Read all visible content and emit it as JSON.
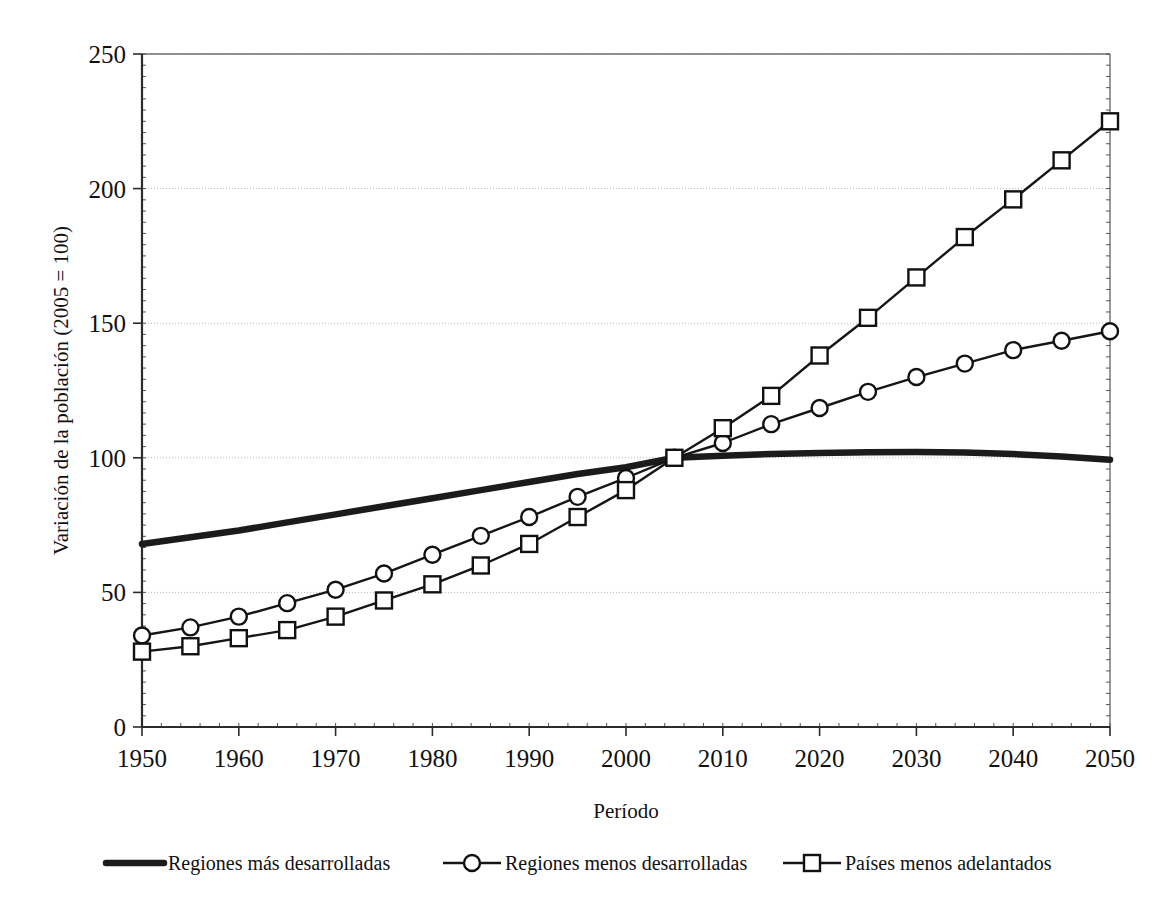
{
  "chart_data": {
    "type": "line",
    "title": "",
    "xlabel": "Período",
    "ylabel": "Variación de la población (2005 = 100)",
    "xlim": [
      1950,
      2050
    ],
    "ylim": [
      0,
      250
    ],
    "xticks": [
      1950,
      1960,
      1970,
      1980,
      1990,
      2000,
      2010,
      2020,
      2030,
      2040,
      2050
    ],
    "xtick_labels": [
      "1950",
      "1960",
      "1970",
      "1980",
      "1990",
      "2000",
      "2010",
      "2020",
      "2030",
      "2040",
      "2050"
    ],
    "yticks": [
      0,
      50,
      100,
      150,
      200,
      250
    ],
    "ytick_labels": [
      "0",
      "50",
      "100",
      "150",
      "200",
      "250"
    ],
    "grid": true,
    "grid_axis": "y",
    "legend_position": "bottom",
    "x": [
      1950,
      1955,
      1960,
      1965,
      1970,
      1975,
      1980,
      1985,
      1990,
      1995,
      2000,
      2005,
      2010,
      2015,
      2020,
      2025,
      2030,
      2035,
      2040,
      2045,
      2050
    ],
    "series": [
      {
        "name": "Regiones más desarrolladas",
        "marker": "none",
        "line_style": "thick",
        "color": "#1b1b1b",
        "values": [
          68,
          70.5,
          73,
          76,
          79,
          82,
          85,
          88,
          91,
          94,
          96.5,
          100,
          100.8,
          101.4,
          101.8,
          102.1,
          102.2,
          102,
          101.4,
          100.5,
          99.3
        ]
      },
      {
        "name": "Regiones menos desarrolladas",
        "marker": "circle",
        "line_style": "thin",
        "color": "#151515",
        "values": [
          34,
          37,
          41,
          46,
          51,
          57,
          64,
          71,
          78,
          85.5,
          92.5,
          100,
          105.5,
          112.5,
          118.5,
          124.5,
          130,
          135,
          140,
          143.5,
          147
        ]
      },
      {
        "name": "Países menos adelantados",
        "marker": "square",
        "line_style": "thin",
        "color": "#151515",
        "values": [
          28,
          30,
          33,
          36,
          41,
          47,
          53,
          60,
          68,
          78,
          88,
          100,
          111,
          123,
          138,
          152,
          167,
          182,
          196,
          210.5,
          225
        ]
      }
    ]
  },
  "legend": {
    "items": [
      {
        "label": "Regiones más desarrolladas",
        "marker": "none"
      },
      {
        "label": "Regiones menos desarrolladas",
        "marker": "circle"
      },
      {
        "label": "Países menos adelantados",
        "marker": "square"
      }
    ]
  }
}
